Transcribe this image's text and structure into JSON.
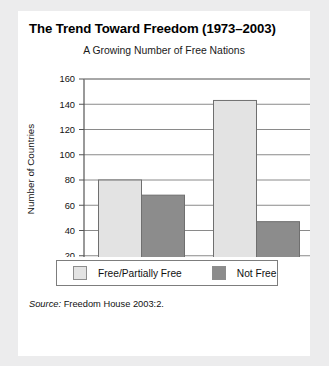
{
  "title": "The Trend Toward Freedom (1973–2003)",
  "subtitle": "A Growing Number of Free Nations",
  "source": {
    "label": "Source:",
    "text": "Freedom House 2003:2."
  },
  "legend": {
    "items": [
      {
        "label": "Free/Partially Free",
        "color": "#e3e3e3"
      },
      {
        "label": "Not Free",
        "color": "#8c8c8c"
      }
    ]
  },
  "colors": {
    "free_partially_free": "#e3e3e3",
    "not_free": "#8c8c8c",
    "bar_outline": "#6f6f6f",
    "axis": "#555555",
    "gridline": "#8a8a8a",
    "card_background": "#ffffff",
    "page_background": "#ececed"
  },
  "chart_data": {
    "type": "bar",
    "title": "A Growing Number of Free Nations",
    "xlabel": "",
    "ylabel": "Number of Countries",
    "categories": [
      "1973",
      "2003"
    ],
    "series": [
      {
        "name": "Free/Partially Free",
        "values": [
          80,
          143
        ]
      },
      {
        "name": "Not Free",
        "values": [
          68,
          47
        ]
      }
    ],
    "ylim": [
      0,
      160
    ],
    "yticks": [
      0,
      20,
      40,
      60,
      80,
      100,
      120,
      140,
      160
    ],
    "grid": true,
    "legend_position": "bottom"
  }
}
